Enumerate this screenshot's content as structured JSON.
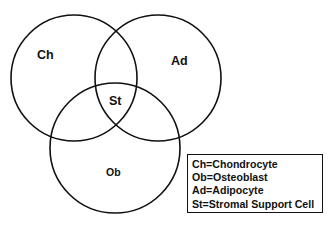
{
  "diagram": {
    "type": "venn",
    "sets": [
      {
        "id": "ch",
        "label": "Ch",
        "cx": 74,
        "cy": 78,
        "r": 64
      },
      {
        "id": "ad",
        "label": "Ad",
        "cx": 158,
        "cy": 78,
        "r": 63
      },
      {
        "id": "ob",
        "label": "Ob",
        "cx": 115,
        "cy": 148,
        "r": 65
      }
    ],
    "intersection_label": "St",
    "legend": {
      "items": [
        {
          "abbr": "Ch",
          "meaning": "Chondrocyte",
          "text": "Ch=Chondrocyte"
        },
        {
          "abbr": "Ob",
          "meaning": "Osteoblast",
          "text": "Ob=Osteoblast"
        },
        {
          "abbr": "Ad",
          "meaning": "Adipocyte",
          "text": "Ad=Adipocyte"
        },
        {
          "abbr": "St",
          "meaning": "Stromal Support Cell",
          "text": "St=Stromal Support Cell"
        }
      ]
    },
    "colors": {
      "stroke": "#111111",
      "background": "#ffffff",
      "text": "#111111"
    }
  }
}
